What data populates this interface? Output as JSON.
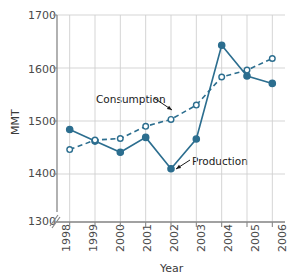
{
  "chart_data": {
    "type": "line",
    "title": "",
    "xlabel": "Year",
    "ylabel": "MMT",
    "categories": [
      "1998",
      "1999",
      "2000",
      "2001",
      "2002",
      "2003",
      "2004",
      "2005",
      "2006"
    ],
    "x": [
      1998,
      1999,
      2000,
      2001,
      2002,
      2003,
      2004,
      2005,
      2006
    ],
    "ylim": [
      1300,
      1700
    ],
    "yticks": [
      1300,
      1400,
      1500,
      1600,
      1700
    ],
    "ytick_labels": [
      "1300",
      "1400",
      "1500",
      "1600",
      "1700"
    ],
    "axis_break": true,
    "axis_break_note": "y-axis broken between 1300 and 1400",
    "grid": true,
    "legend": "inline-annotations",
    "series": [
      {
        "name": "Production",
        "style": "solid",
        "marker": "filled-circle",
        "color": "#2c6e8f",
        "values": [
          1484,
          1462,
          1441,
          1469,
          1410,
          1466,
          1643,
          1585,
          1571
        ]
      },
      {
        "name": "Consumption",
        "style": "dashed",
        "marker": "open-circle",
        "color": "#2c6e8f",
        "values": [
          1446,
          1464,
          1467,
          1490,
          1503,
          1530,
          1583,
          1596,
          1618
        ]
      }
    ],
    "annotations": [
      {
        "text": "Consumption",
        "target_series": "Consumption"
      },
      {
        "text": "Production",
        "target_series": "Production"
      }
    ]
  },
  "colors": {
    "line": "#2c6e8f",
    "grid": "#d0d0d0",
    "axis": "#888888",
    "text": "#4a4a4a",
    "background": "#ffffff"
  }
}
